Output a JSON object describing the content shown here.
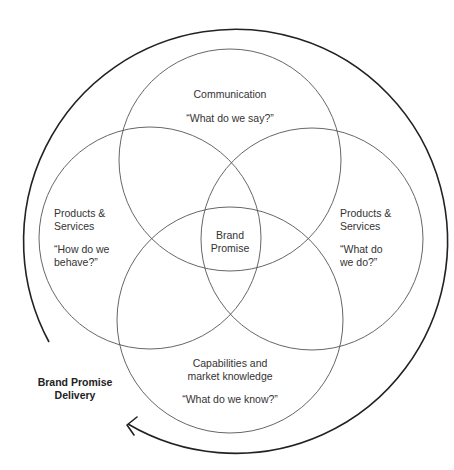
{
  "diagram": {
    "type": "venn",
    "colors": {
      "stroke": "#444444",
      "outer_stroke": "#222222",
      "text": "#333333",
      "background": "#ffffff"
    },
    "circles": [
      {
        "id": "communication",
        "title": "Communication",
        "question": "“What do we say?”"
      },
      {
        "id": "products-left",
        "title": "Products &\nServices",
        "question": "“How do we\nbehave?”"
      },
      {
        "id": "products-right",
        "title": "Products &\nServices",
        "question": "“What do\nwe do?”"
      },
      {
        "id": "capabilities",
        "title": "Capabilities and\nmarket knowledge",
        "question": "“What do we know?”"
      }
    ],
    "center_label": "Brand\nPromise",
    "outer_label": "Brand Promise\nDelivery"
  }
}
